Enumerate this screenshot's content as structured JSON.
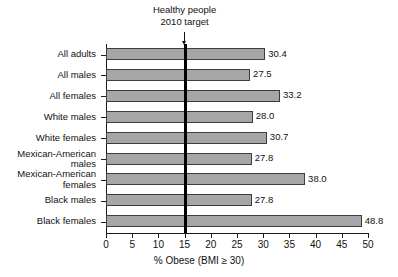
{
  "chart_data": {
    "type": "bar",
    "orientation": "horizontal",
    "title": "",
    "xlabel": "% Obese (BMI ≥ 30)",
    "ylabel": "",
    "xlim": [
      0,
      50
    ],
    "grid": false,
    "legend": null,
    "categories": [
      "All adults",
      "All males",
      "All females",
      "White males",
      "White females",
      "Mexican-American\nmales",
      "Mexican-American\nfemales",
      "Black males",
      "Black females"
    ],
    "values": [
      30.4,
      27.5,
      33.2,
      28.0,
      30.7,
      27.8,
      38.0,
      27.8,
      48.8
    ],
    "value_labels": [
      "30.4",
      "27.5",
      "33.2",
      "28.0",
      "30.7",
      "27.8",
      "38.0",
      "27.8",
      "48.8"
    ],
    "xticks": [
      0,
      5,
      10,
      15,
      20,
      25,
      30,
      35,
      40,
      45,
      50
    ],
    "xtick_labels": [
      "0",
      "5",
      "10",
      "15",
      "20",
      "25",
      "30",
      "35",
      "40",
      "45",
      "50"
    ],
    "annotations": [
      {
        "name": "healthy-people-target",
        "text_line1": "Healthy people",
        "text_line2": "2010 target",
        "value": 15,
        "marker": "vertical-line-with-down-arrow"
      }
    ],
    "colors": {
      "bar_fill": "#a6a6a6",
      "bar_edge": "#3d3d3d",
      "axis": "#1a1a1a",
      "target_line": "#000000",
      "text": "#111111",
      "background": "#ffffff"
    }
  }
}
